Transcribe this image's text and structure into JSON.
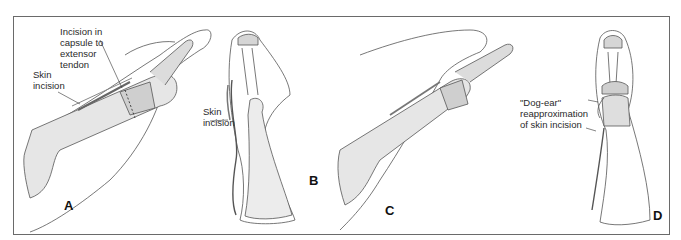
{
  "figure": {
    "panels": [
      {
        "id": "A",
        "label": "A",
        "annotations": [
          {
            "text": "Incision in\ncapsule to\nextensor\ntendon"
          },
          {
            "text": "Skin\nincision"
          }
        ]
      },
      {
        "id": "B",
        "label": "B",
        "annotations": [
          {
            "text": "Skin\nincision"
          }
        ]
      },
      {
        "id": "C",
        "label": "C",
        "annotations": []
      },
      {
        "id": "D",
        "label": "D",
        "annotations": [
          {
            "text": "\"Dog-ear\"\nreapproximation\nof skin incision"
          }
        ]
      }
    ],
    "colors": {
      "line": "#4a4a4a",
      "bone_fill": "#e6e6e6",
      "shade": "#b8b8b8",
      "frame": "#6a6a6a"
    }
  }
}
